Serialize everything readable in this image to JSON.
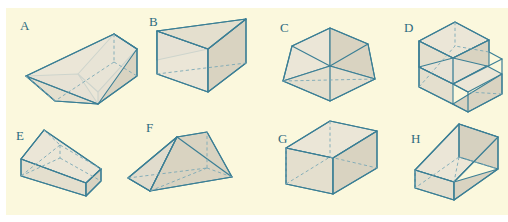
{
  "figure": {
    "kind": "geometry-solids-plate",
    "background_color": "#ffffff",
    "panel_color": "#fbf8dd",
    "line_color": "#3b7f95",
    "hidden_line_color": "#7aa8b6",
    "face_fill_color": "#ded9cb",
    "label_color": "#2d6b80",
    "rows": 2,
    "columns": 4,
    "count": 8
  },
  "solids": [
    {
      "label": "A",
      "name": "wedge-ramp-prism",
      "description": "Triangular prism wedge resting on its rectangular base with a sloping top face descending to the left",
      "row": 1,
      "column": 1
    },
    {
      "label": "B",
      "name": "triangular-prism-horizontal",
      "description": "Triangular prism lying lengthwise with a vertical edge facing the viewer",
      "row": 1,
      "column": 2
    },
    {
      "label": "C",
      "name": "triangular-prism-end-on",
      "description": "Short triangular prism seen almost end on, giving a pentagon-like silhouette",
      "row": 1,
      "column": 3
    },
    {
      "label": "D",
      "name": "two-step-staircase-solid",
      "description": "Rectangular solid cut into two stepped levels like a staircase",
      "row": 1,
      "column": 4
    },
    {
      "label": "E",
      "name": "flat-wedge-ramp",
      "description": "Low flat wedge with a long sloping upper face rising to the left",
      "row": 2,
      "column": 1
    },
    {
      "label": "F",
      "name": "tent-prism-ridge",
      "description": "Triangular prism standing like a tent with a ridge line along the top",
      "row": 2,
      "column": 2
    },
    {
      "label": "G",
      "name": "rectangular-box-cuboid",
      "description": "Rectangular box or cuboid drawn in transparent wireframe",
      "row": 2,
      "column": 3
    },
    {
      "label": "H",
      "name": "wedge-vertical-back",
      "description": "Wedge with a tall vertical back face sloping down toward the front left",
      "row": 2,
      "column": 4
    }
  ]
}
